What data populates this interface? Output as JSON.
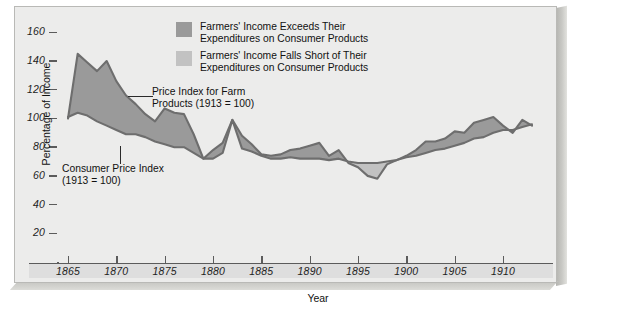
{
  "chart_data": {
    "type": "area",
    "title": "",
    "xlabel": "Year",
    "ylabel": "Percentage of Income",
    "xlim": [
      1865,
      1913
    ],
    "ylim": [
      0,
      170
    ],
    "yticks": [
      20,
      40,
      60,
      80,
      100,
      120,
      140,
      160
    ],
    "xticks": [
      1865,
      1870,
      1875,
      1880,
      1885,
      1890,
      1895,
      1900,
      1905,
      1910
    ],
    "grid": false,
    "legend_position": "top-center",
    "x": [
      1865,
      1866,
      1867,
      1868,
      1869,
      1870,
      1871,
      1872,
      1873,
      1874,
      1875,
      1876,
      1877,
      1878,
      1879,
      1880,
      1881,
      1882,
      1883,
      1884,
      1885,
      1886,
      1887,
      1888,
      1889,
      1890,
      1891,
      1892,
      1893,
      1894,
      1895,
      1896,
      1897,
      1898,
      1899,
      1900,
      1901,
      1902,
      1903,
      1904,
      1905,
      1906,
      1907,
      1908,
      1909,
      1910,
      1911,
      1912,
      1913
    ],
    "series": [
      {
        "name": "Price Index for Farm Products (1913 = 100)",
        "key": "farm",
        "color": "#6e6e6e",
        "values": [
          100,
          145,
          139,
          133,
          140,
          126,
          116,
          110,
          103,
          98,
          107,
          104,
          103,
          89,
          72,
          78,
          83,
          99,
          88,
          82,
          75,
          74,
          75,
          78,
          79,
          81,
          83,
          74,
          78,
          69,
          66,
          60,
          58,
          68,
          71,
          74,
          78,
          84,
          84,
          86,
          91,
          90,
          97,
          99,
          101,
          95,
          90,
          99,
          95
        ]
      },
      {
        "name": "Consumer Price Index (1913 = 100)",
        "key": "cpi",
        "color": "#6e6e6e",
        "values": [
          101,
          104,
          102,
          98,
          95,
          92,
          89,
          89,
          87,
          84,
          82,
          80,
          80,
          76,
          72,
          72,
          76,
          99,
          79,
          77,
          74,
          72,
          72,
          73,
          72,
          72,
          72,
          71,
          72,
          70,
          69,
          69,
          69,
          70,
          71,
          73,
          74,
          76,
          78,
          79,
          81,
          83,
          86,
          87,
          90,
          92,
          92,
          94,
          96
        ]
      }
    ],
    "band_above_label": "Farmers' Income Exceeds Their Expenditures on Consumer Products",
    "band_below_label": "Farmers' Income Falls Short of Their Expenditures on Consumer Products",
    "band_above_color": "#9a9a9a",
    "band_below_color": "#c2c2c2"
  },
  "axes": {
    "y_title": "Percentage of Income",
    "x_title": "Year",
    "y_labels": [
      "160",
      "140",
      "120",
      "100",
      "80",
      "60",
      "40",
      "20"
    ],
    "x_labels": [
      "1865",
      "1870",
      "1875",
      "1880",
      "1885",
      "1890",
      "1895",
      "1900",
      "1905",
      "1910"
    ]
  },
  "legend": {
    "items": [
      {
        "label": "Farmers' Income Exceeds Their\nExpenditures on Consumer Products",
        "swatch": "#9a9a9a"
      },
      {
        "label": "Farmers' Income Falls Short of Their\nExpenditures on Consumer Products",
        "swatch": "#c2c2c2"
      }
    ]
  },
  "annotations": {
    "farm": "Price Index for Farm\nProducts (1913 = 100)",
    "cpi": "Consumer Price Index\n(1913 = 100)"
  }
}
